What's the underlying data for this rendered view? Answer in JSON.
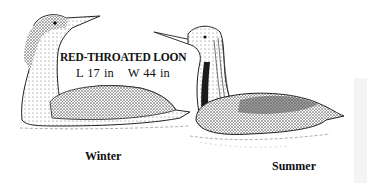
{
  "illustration": {
    "species_title": "RED-THROATED LOON",
    "length": "L 17 in",
    "wingspan": "W 44 in",
    "birds": [
      {
        "label": "Winter",
        "plumage": "winter"
      },
      {
        "label": "Summer",
        "plumage": "summer"
      }
    ],
    "colors": {
      "ink": "#111111",
      "background": "#ffffff",
      "side_panel": "#f4f4f4"
    }
  }
}
